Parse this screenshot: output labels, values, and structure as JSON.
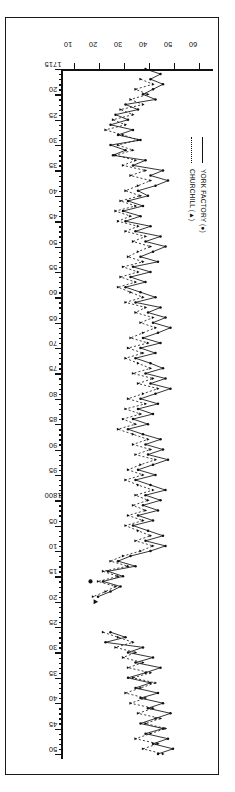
{
  "figure": {
    "legend": {
      "entries": [
        {
          "label": "YORK FACTORY (●)",
          "style": "solid",
          "marker": "circle"
        },
        {
          "label": "CHURCHILL (▲)",
          "style": "dotted",
          "marker": "triangle"
        }
      ]
    },
    "xaxis": {
      "title": "",
      "range": [
        1715,
        1851
      ],
      "major_tick_labels": [
        "1715",
        "20",
        "25",
        "30",
        "35",
        "40",
        "45",
        "50",
        "55",
        "60",
        "65",
        "70",
        "75",
        "80",
        "85",
        "90",
        "95",
        "1800",
        "05",
        "10",
        "15",
        "20",
        "25",
        "30",
        "35",
        "40",
        "45",
        "50"
      ],
      "major_tick_values": [
        1715,
        1720,
        1725,
        1730,
        1735,
        1740,
        1745,
        1750,
        1755,
        1760,
        1765,
        1770,
        1775,
        1780,
        1785,
        1790,
        1795,
        1800,
        1805,
        1810,
        1815,
        1820,
        1825,
        1830,
        1835,
        1840,
        1845,
        1850
      ],
      "minor_tick_interval": 1
    },
    "yaxis": {
      "title": "DAYS",
      "range": [
        5,
        65
      ],
      "tick_labels": [
        "10",
        "20",
        "30",
        "40",
        "50",
        "60"
      ],
      "tick_values": [
        10,
        20,
        30,
        40,
        50,
        60
      ]
    }
  },
  "chart_data": {
    "type": "line",
    "title": "",
    "xlabel": "",
    "ylabel": "DAYS",
    "xlim": [
      1715,
      1851
    ],
    "ylim": [
      5,
      65
    ],
    "grid": false,
    "legend_position": "upper-left",
    "series": [
      {
        "name": "YORK FACTORY (●)",
        "style": "solid",
        "marker": "circle",
        "points": [
          [
            1715,
            38
          ],
          [
            1716,
            44
          ],
          [
            1717,
            40
          ],
          [
            1718,
            45
          ],
          [
            1719,
            41
          ],
          [
            1720,
            37
          ],
          [
            1721,
            42
          ],
          [
            1722,
            30
          ],
          [
            1723,
            35
          ],
          [
            1724,
            26
          ],
          [
            1725,
            31
          ],
          [
            1726,
            24
          ],
          [
            1727,
            33
          ],
          [
            1728,
            27
          ],
          [
            1729,
            36
          ],
          [
            1730,
            24
          ],
          [
            1731,
            30
          ],
          [
            1732,
            25
          ],
          [
            1733,
            38
          ],
          [
            1734,
            33
          ],
          [
            1735,
            45
          ],
          [
            1736,
            40
          ],
          [
            1737,
            47
          ],
          [
            1738,
            42
          ],
          [
            1739,
            35
          ],
          [
            1740,
            39
          ],
          [
            1741,
            31
          ],
          [
            1742,
            37
          ],
          [
            1743,
            29
          ],
          [
            1744,
            36
          ],
          [
            1745,
            30
          ],
          [
            1746,
            40
          ],
          [
            1747,
            34
          ],
          [
            1748,
            44
          ],
          [
            1749,
            38
          ],
          [
            1750,
            46
          ],
          [
            1751,
            41
          ],
          [
            1752,
            36
          ],
          [
            1753,
            43
          ],
          [
            1754,
            33
          ],
          [
            1755,
            40
          ],
          [
            1756,
            32
          ],
          [
            1757,
            38
          ],
          [
            1758,
            30
          ],
          [
            1759,
            36
          ],
          [
            1760,
            42
          ],
          [
            1761,
            34
          ],
          [
            1762,
            44
          ],
          [
            1763,
            39
          ],
          [
            1764,
            46
          ],
          [
            1765,
            41
          ],
          [
            1766,
            48
          ],
          [
            1767,
            43
          ],
          [
            1768,
            37
          ],
          [
            1769,
            44
          ],
          [
            1770,
            36
          ],
          [
            1771,
            42
          ],
          [
            1772,
            34
          ],
          [
            1773,
            40
          ],
          [
            1774,
            45
          ],
          [
            1775,
            38
          ],
          [
            1776,
            46
          ],
          [
            1777,
            40
          ],
          [
            1778,
            48
          ],
          [
            1779,
            42
          ],
          [
            1780,
            36
          ],
          [
            1781,
            43
          ],
          [
            1782,
            35
          ],
          [
            1783,
            41
          ],
          [
            1784,
            33
          ],
          [
            1785,
            39
          ],
          [
            1786,
            31
          ],
          [
            1787,
            37
          ],
          [
            1788,
            44
          ],
          [
            1789,
            38
          ],
          [
            1790,
            45
          ],
          [
            1791,
            39
          ],
          [
            1792,
            47
          ],
          [
            1793,
            41
          ],
          [
            1794,
            35
          ],
          [
            1795,
            42
          ],
          [
            1796,
            34
          ],
          [
            1797,
            40
          ],
          [
            1798,
            46
          ],
          [
            1799,
            38
          ],
          [
            1800,
            44
          ],
          [
            1801,
            37
          ],
          [
            1802,
            43
          ],
          [
            1803,
            35
          ],
          [
            1804,
            41
          ],
          [
            1805,
            33
          ],
          [
            1806,
            39
          ],
          [
            1807,
            45
          ],
          [
            1808,
            38
          ],
          [
            1809,
            46
          ],
          [
            1810,
            40
          ],
          [
            1811,
            32
          ],
          [
            1812,
            27
          ],
          [
            1813,
            34
          ],
          [
            1814,
            23
          ],
          [
            1815,
            29
          ],
          [
            1816,
            21
          ],
          [
            1817,
            28
          ],
          [
            1818,
            24
          ],
          [
            1819,
            19
          ]
        ]
      },
      {
        "name": "CHURCHILL (▲)",
        "style": "dotted",
        "marker": "triangle",
        "points": [
          [
            1717,
            36
          ],
          [
            1718,
            41
          ],
          [
            1719,
            34
          ],
          [
            1720,
            39
          ],
          [
            1721,
            32
          ],
          [
            1722,
            37
          ],
          [
            1723,
            28
          ],
          [
            1724,
            33
          ],
          [
            1725,
            25
          ],
          [
            1726,
            30
          ],
          [
            1727,
            22
          ],
          [
            1728,
            29
          ],
          [
            1729,
            35
          ],
          [
            1730,
            27
          ],
          [
            1731,
            33
          ],
          [
            1732,
            26
          ],
          [
            1733,
            34
          ],
          [
            1734,
            29
          ],
          [
            1735,
            38
          ],
          [
            1736,
            32
          ],
          [
            1737,
            40
          ],
          [
            1738,
            35
          ],
          [
            1739,
            30
          ],
          [
            1740,
            36
          ],
          [
            1741,
            28
          ],
          [
            1742,
            34
          ],
          [
            1743,
            26
          ],
          [
            1744,
            32
          ],
          [
            1745,
            27
          ],
          [
            1746,
            35
          ],
          [
            1747,
            30
          ],
          [
            1748,
            38
          ],
          [
            1749,
            33
          ],
          [
            1750,
            40
          ],
          [
            1751,
            35
          ],
          [
            1752,
            31
          ],
          [
            1753,
            37
          ],
          [
            1754,
            29
          ],
          [
            1755,
            35
          ],
          [
            1756,
            28
          ],
          [
            1757,
            34
          ],
          [
            1758,
            27
          ],
          [
            1759,
            32
          ],
          [
            1760,
            37
          ],
          [
            1761,
            30
          ],
          [
            1762,
            38
          ],
          [
            1763,
            34
          ],
          [
            1764,
            41
          ],
          [
            1765,
            36
          ],
          [
            1766,
            42
          ],
          [
            1767,
            37
          ],
          [
            1768,
            32
          ],
          [
            1769,
            39
          ],
          [
            1770,
            31
          ],
          [
            1771,
            37
          ],
          [
            1772,
            30
          ],
          [
            1773,
            35
          ],
          [
            1774,
            40
          ],
          [
            1775,
            33
          ],
          [
            1776,
            41
          ],
          [
            1777,
            35
          ],
          [
            1778,
            43
          ],
          [
            1779,
            37
          ],
          [
            1780,
            31
          ],
          [
            1781,
            38
          ],
          [
            1782,
            30
          ],
          [
            1783,
            36
          ],
          [
            1784,
            29
          ],
          [
            1785,
            34
          ],
          [
            1786,
            27
          ],
          [
            1787,
            33
          ],
          [
            1788,
            39
          ],
          [
            1789,
            33
          ],
          [
            1790,
            40
          ],
          [
            1791,
            34
          ],
          [
            1792,
            42
          ],
          [
            1793,
            36
          ],
          [
            1794,
            31
          ],
          [
            1795,
            37
          ],
          [
            1796,
            30
          ],
          [
            1797,
            35
          ],
          [
            1798,
            41
          ],
          [
            1799,
            34
          ],
          [
            1800,
            39
          ],
          [
            1801,
            33
          ],
          [
            1802,
            38
          ],
          [
            1803,
            31
          ],
          [
            1804,
            37
          ],
          [
            1805,
            30
          ],
          [
            1806,
            35
          ],
          [
            1807,
            40
          ],
          [
            1808,
            34
          ],
          [
            1809,
            41
          ],
          [
            1810,
            36
          ],
          [
            1811,
            29
          ],
          [
            1812,
            24
          ],
          [
            1813,
            31
          ],
          [
            1814,
            21
          ],
          [
            1815,
            27
          ],
          [
            1816,
            19
          ],
          [
            1817,
            26
          ],
          [
            1818,
            22
          ],
          [
            1819,
            17
          ]
        ]
      },
      {
        "name": "YORK FACTORY (●) late segment",
        "style": "solid",
        "marker": "circle",
        "points": [
          [
            1826,
            24
          ],
          [
            1827,
            30
          ],
          [
            1828,
            22
          ],
          [
            1829,
            37
          ],
          [
            1830,
            31
          ],
          [
            1831,
            41
          ],
          [
            1832,
            34
          ],
          [
            1833,
            44
          ],
          [
            1834,
            38
          ],
          [
            1835,
            31
          ],
          [
            1836,
            40
          ],
          [
            1837,
            34
          ],
          [
            1838,
            43
          ],
          [
            1839,
            36
          ],
          [
            1840,
            45
          ],
          [
            1841,
            39
          ],
          [
            1842,
            48
          ],
          [
            1843,
            42
          ],
          [
            1844,
            36
          ],
          [
            1845,
            45
          ],
          [
            1846,
            38
          ],
          [
            1847,
            47
          ],
          [
            1848,
            41
          ],
          [
            1849,
            49
          ],
          [
            1850,
            43
          ]
        ]
      },
      {
        "name": "CHURCHILL (▲) late segment",
        "style": "dotted",
        "marker": "triangle",
        "points": [
          [
            1826,
            21
          ],
          [
            1827,
            27
          ],
          [
            1828,
            33
          ],
          [
            1829,
            26
          ],
          [
            1830,
            34
          ],
          [
            1831,
            29
          ],
          [
            1832,
            37
          ],
          [
            1833,
            31
          ],
          [
            1834,
            40
          ],
          [
            1835,
            33
          ],
          [
            1836,
            42
          ],
          [
            1837,
            36
          ],
          [
            1838,
            30
          ],
          [
            1839,
            38
          ],
          [
            1840,
            32
          ],
          [
            1841,
            41
          ],
          [
            1842,
            35
          ],
          [
            1843,
            44
          ],
          [
            1844,
            38
          ],
          [
            1845,
            46
          ],
          [
            1846,
            40
          ],
          [
            1847,
            34
          ],
          [
            1848,
            43
          ],
          [
            1849,
            37
          ],
          [
            1850,
            45
          ]
        ]
      }
    ],
    "isolated_markers": [
      {
        "series": "CHURCHILL (▲)",
        "x": 1820,
        "y": 18,
        "marker": "triangle"
      },
      {
        "series": "YORK FACTORY (●)",
        "x": 1816,
        "y": 16,
        "marker": "circle"
      }
    ]
  }
}
